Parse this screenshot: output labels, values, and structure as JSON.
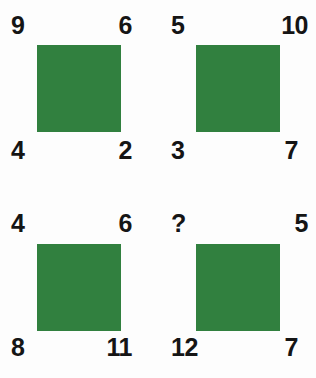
{
  "puzzle": {
    "type": "visual-number-logic-puzzle",
    "layout": {
      "rows": 2,
      "columns": 2
    },
    "colors": {
      "square_fill": "#31803f",
      "number_text": "#151515",
      "background": "#fdfdfd"
    },
    "panels": [
      {
        "id": "panel-1",
        "position": "top-left",
        "shape": "green-square",
        "corners": {
          "top_left": "9",
          "top_right": "6",
          "bottom_left": "4",
          "bottom_right": "2"
        }
      },
      {
        "id": "panel-2",
        "position": "top-right",
        "shape": "green-square",
        "corners": {
          "top_left": "5",
          "top_right": "10",
          "bottom_left": "3",
          "bottom_right": "7"
        }
      },
      {
        "id": "panel-3",
        "position": "bottom-left",
        "shape": "green-square",
        "corners": {
          "top_left": "4",
          "top_right": "6",
          "bottom_left": "8",
          "bottom_right": "11"
        }
      },
      {
        "id": "panel-4",
        "position": "bottom-right",
        "shape": "green-square",
        "corners": {
          "top_left": "?",
          "top_right": "5",
          "bottom_left": "12",
          "bottom_right": "7"
        }
      }
    ]
  }
}
